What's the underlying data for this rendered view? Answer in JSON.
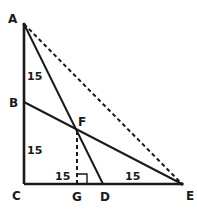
{
  "diagram": {
    "title": "",
    "points": {
      "A": "A",
      "B": "B",
      "C": "C",
      "D": "D",
      "E": "E",
      "F": "F",
      "G": "G"
    },
    "measurements": {
      "AB": "15",
      "BC": "15",
      "CG": "15",
      "DE": "15"
    },
    "segments": [
      {
        "from": "A",
        "to": "C",
        "style": "solid"
      },
      {
        "from": "C",
        "to": "E",
        "style": "solid"
      },
      {
        "from": "A",
        "to": "D",
        "style": "solid"
      },
      {
        "from": "B",
        "to": "E",
        "style": "solid"
      },
      {
        "from": "A",
        "to": "E",
        "style": "dashed"
      },
      {
        "from": "F",
        "to": "G",
        "style": "dashed"
      }
    ],
    "right_angle_marks": [
      "C",
      "G"
    ]
  }
}
